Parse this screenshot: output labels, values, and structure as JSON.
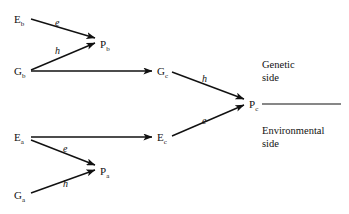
{
  "figure": {
    "type": "path-diagram",
    "background_color": "#ffffff",
    "ink_color": "#111111"
  },
  "nodes": [
    {
      "id": "Eb",
      "base": "E",
      "sub": "b",
      "x": 14,
      "y": 14
    },
    {
      "id": "Pb",
      "base": "P",
      "sub": "b",
      "x": 100,
      "y": 39
    },
    {
      "id": "Gb",
      "base": "G",
      "sub": "b",
      "x": 14,
      "y": 66
    },
    {
      "id": "Gc",
      "base": "G",
      "sub": "c",
      "x": 157,
      "y": 66
    },
    {
      "id": "Pc",
      "base": "P",
      "sub": "c",
      "x": 249,
      "y": 99
    },
    {
      "id": "Ea",
      "base": "E",
      "sub": "a",
      "x": 14,
      "y": 132
    },
    {
      "id": "Ec",
      "base": "E",
      "sub": "c",
      "x": 157,
      "y": 132
    },
    {
      "id": "Pa",
      "base": "P",
      "sub": "a",
      "x": 100,
      "y": 166
    },
    {
      "id": "Ga",
      "base": "G",
      "sub": "a",
      "x": 14,
      "y": 190
    }
  ],
  "edges": [
    {
      "from": "Eb",
      "to": "Pb",
      "label": "e",
      "label_x": 55,
      "label_y": 18
    },
    {
      "from": "Gb",
      "to": "Pb",
      "label": "h",
      "label_x": 55,
      "label_y": 46
    },
    {
      "from": "Gb",
      "to": "Gc",
      "label": "",
      "label_x": 0,
      "label_y": 0
    },
    {
      "from": "Gc",
      "to": "Pc",
      "label": "h",
      "label_x": 202,
      "label_y": 74
    },
    {
      "from": "Ea",
      "to": "Ec",
      "label": "",
      "label_x": 0,
      "label_y": 0
    },
    {
      "from": "Ea",
      "to": "Pa",
      "label": "e",
      "label_x": 63,
      "label_y": 144
    },
    {
      "from": "Ga",
      "to": "Pa",
      "label": "h",
      "label_x": 63,
      "label_y": 179
    },
    {
      "from": "Ec",
      "to": "Pc",
      "label": "e",
      "label_x": 202,
      "label_y": 116
    }
  ],
  "annotations": {
    "genetic_side": {
      "line1": "Genetic",
      "line2": "side",
      "x": 262,
      "y": 58
    },
    "environmental_side": {
      "line1": "Environmental",
      "line2": "side",
      "x": 262,
      "y": 124
    }
  },
  "divider": {
    "x1": 262,
    "y1": 104,
    "x2": 341,
    "y2": 104
  }
}
